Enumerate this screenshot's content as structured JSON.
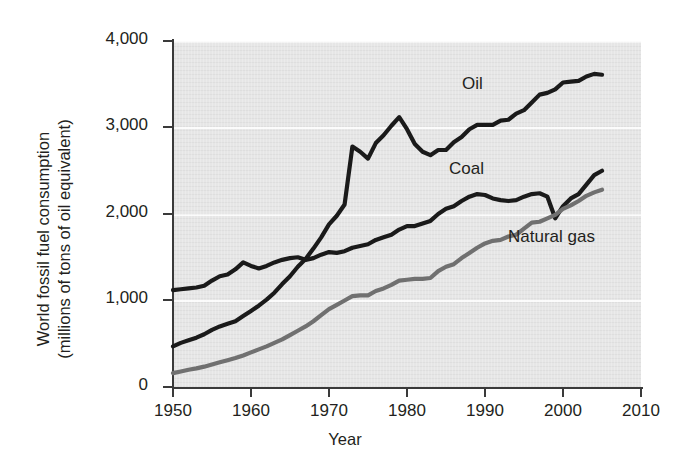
{
  "chart_data": {
    "type": "line",
    "title": "",
    "xlabel": "Year",
    "ylabel": "World fossil fuel consumption (millions of tons of oil equivalent)",
    "ylabel_line1": "World fossil fuel consumption",
    "ylabel_line2": "(millions of tons of oil equivalent)",
    "xlim": [
      1950,
      2010
    ],
    "ylim": [
      0,
      4000
    ],
    "xticks": [
      1950,
      1960,
      1970,
      1980,
      1990,
      2000,
      2010
    ],
    "xtick_labels": [
      "1950",
      "1960",
      "1970",
      "1980",
      "1990",
      "2000",
      "2010"
    ],
    "yticks": [
      0,
      1000,
      2000,
      3000,
      4000
    ],
    "ytick_labels": [
      "0",
      "1,000",
      "2,000",
      "3,000",
      "4,000"
    ],
    "grid": "horizontal white gridlines on gray panel",
    "legend_position": "inline labels at end of each series",
    "plot_background": "#e6e6e6",
    "series": [
      {
        "name": "Oil",
        "color": "#1a1a1a",
        "label_position": {
          "x": 1987,
          "y": 3430
        },
        "x": [
          1950,
          1951,
          1952,
          1953,
          1954,
          1955,
          1956,
          1957,
          1958,
          1959,
          1960,
          1961,
          1962,
          1963,
          1964,
          1965,
          1966,
          1967,
          1968,
          1969,
          1970,
          1971,
          1972,
          1973,
          1974,
          1975,
          1976,
          1977,
          1978,
          1979,
          1980,
          1981,
          1982,
          1983,
          1984,
          1985,
          1986,
          1987,
          1988,
          1989,
          1990,
          1991,
          1992,
          1993,
          1994,
          1995,
          1996,
          1997,
          1998,
          1999,
          2000,
          2001,
          2002,
          2003,
          2004,
          2005
        ],
        "values": [
          470,
          510,
          540,
          570,
          610,
          660,
          700,
          730,
          760,
          820,
          880,
          940,
          1010,
          1090,
          1190,
          1280,
          1390,
          1480,
          1600,
          1730,
          1880,
          1980,
          2110,
          2780,
          2720,
          2640,
          2820,
          2910,
          3020,
          3120,
          2980,
          2810,
          2720,
          2680,
          2740,
          2740,
          2830,
          2890,
          2980,
          3030,
          3030,
          3030,
          3080,
          3090,
          3160,
          3200,
          3290,
          3380,
          3400,
          3440,
          3520,
          3530,
          3540,
          3590,
          3620,
          3610
        ]
      },
      {
        "name": "Coal",
        "color": "#1a1a1a",
        "label_position": {
          "x": 1975,
          "y": 2320
        },
        "x": [
          1950,
          1951,
          1952,
          1953,
          1954,
          1955,
          1956,
          1957,
          1958,
          1959,
          1960,
          1961,
          1962,
          1963,
          1964,
          1965,
          1966,
          1967,
          1968,
          1969,
          1970,
          1971,
          1972,
          1973,
          1974,
          1975,
          1976,
          1977,
          1978,
          1979,
          1980,
          1981,
          1982,
          1983,
          1984,
          1985,
          1986,
          1987,
          1988,
          1989,
          1990,
          1991,
          1992,
          1993,
          1994,
          1995,
          1996,
          1997,
          1998,
          1999,
          2000,
          2001,
          2002,
          2003,
          2004,
          2005
        ],
        "values": [
          1120,
          1130,
          1140,
          1150,
          1170,
          1230,
          1280,
          1300,
          1360,
          1440,
          1400,
          1370,
          1400,
          1440,
          1470,
          1490,
          1500,
          1470,
          1490,
          1530,
          1560,
          1550,
          1570,
          1610,
          1630,
          1650,
          1700,
          1730,
          1760,
          1820,
          1860,
          1860,
          1890,
          1920,
          2000,
          2060,
          2090,
          2150,
          2200,
          2230,
          2220,
          2180,
          2160,
          2150,
          2160,
          2200,
          2230,
          2240,
          2200,
          1950,
          2090,
          2180,
          2230,
          2340,
          2450,
          2500
        ]
      },
      {
        "name": "Natural gas",
        "color": "#707070",
        "label_position": {
          "x": 1993,
          "y": 1560
        },
        "x": [
          1950,
          1951,
          1952,
          1953,
          1954,
          1955,
          1956,
          1957,
          1958,
          1959,
          1960,
          1961,
          1962,
          1963,
          1964,
          1965,
          1966,
          1967,
          1968,
          1969,
          1970,
          1971,
          1972,
          1973,
          1974,
          1975,
          1976,
          1977,
          1978,
          1979,
          1980,
          1981,
          1982,
          1983,
          1984,
          1985,
          1986,
          1987,
          1988,
          1989,
          1990,
          1991,
          1992,
          1993,
          1994,
          1995,
          1996,
          1997,
          1998,
          1999,
          2000,
          2001,
          2002,
          2003,
          2004,
          2005
        ],
        "values": [
          160,
          180,
          200,
          215,
          235,
          260,
          285,
          310,
          335,
          365,
          400,
          435,
          470,
          510,
          550,
          600,
          650,
          700,
          760,
          830,
          900,
          950,
          1000,
          1050,
          1060,
          1060,
          1110,
          1140,
          1180,
          1230,
          1240,
          1250,
          1250,
          1260,
          1340,
          1390,
          1420,
          1490,
          1550,
          1610,
          1660,
          1690,
          1700,
          1740,
          1760,
          1830,
          1900,
          1910,
          1950,
          1990,
          2060,
          2100,
          2150,
          2210,
          2250,
          2280
        ]
      }
    ]
  },
  "axes": {
    "x_title": "Year",
    "y_title_line1": "World fossil fuel consumption",
    "y_title_line2": "(millions of tons of oil equivalent)"
  }
}
